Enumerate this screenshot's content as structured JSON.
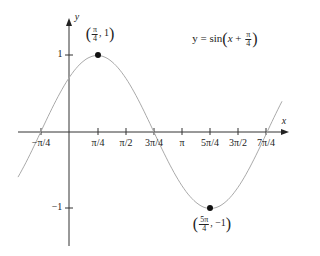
{
  "equation": {
    "lhs": "y = sin",
    "var": "x",
    "plus": "+",
    "num": "π",
    "den": "4"
  },
  "axes": {
    "x_label": "x",
    "y_label": "y"
  },
  "x_ticks": [
    "−π/4",
    "π/4",
    "π/2",
    "3π/4",
    "π",
    "5π/4",
    "3π/2",
    "7π/4"
  ],
  "y_ticks": [
    "1",
    "−1"
  ],
  "points": {
    "max": {
      "num": "π",
      "den": "4",
      "y": "1"
    },
    "min": {
      "num": "5π",
      "den": "4",
      "y": "−1"
    }
  },
  "chart_data": {
    "type": "line",
    "xlabel": "x",
    "ylabel": "y",
    "x_tick_labels": [
      "−π/4",
      "π/4",
      "π/2",
      "3π/4",
      "π",
      "5π/4",
      "3π/2",
      "7π/4"
    ],
    "y_tick_labels": [
      "1",
      "−1"
    ],
    "series": [
      {
        "name": "y = sin(x + π/4)",
        "function": "sin(x + π/4)",
        "x_range": [
          "-π/2",
          "2π"
        ]
      }
    ],
    "annotations": [
      {
        "label": "(π/4, 1)",
        "x": 0.7854,
        "y": 1,
        "marker": "dot"
      },
      {
        "label": "(5π/4, −1)",
        "x": 3.927,
        "y": -1,
        "marker": "dot"
      }
    ],
    "ylim": [
      -1.3,
      1.5
    ],
    "grid": false
  }
}
